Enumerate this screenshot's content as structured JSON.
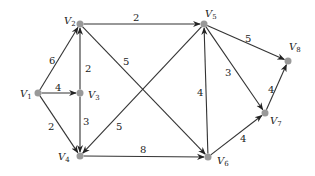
{
  "graph": {
    "nodes": [
      {
        "id": "V1",
        "label": "V",
        "sub": "1",
        "x": 38,
        "y": 93,
        "lx": 20,
        "ly": 97
      },
      {
        "id": "V2",
        "label": "V",
        "sub": "2",
        "x": 80,
        "y": 24,
        "lx": 64,
        "ly": 24
      },
      {
        "id": "V3",
        "label": "V",
        "sub": "3",
        "x": 80,
        "y": 93,
        "lx": 88,
        "ly": 98
      },
      {
        "id": "V4",
        "label": "V",
        "sub": "4",
        "x": 80,
        "y": 156,
        "lx": 58,
        "ly": 160
      },
      {
        "id": "V5",
        "label": "V",
        "sub": "5",
        "x": 204,
        "y": 24,
        "lx": 205,
        "ly": 17
      },
      {
        "id": "V6",
        "label": "V",
        "sub": "6",
        "x": 208,
        "y": 157,
        "lx": 217,
        "ly": 164
      },
      {
        "id": "V7",
        "label": "V",
        "sub": "7",
        "x": 265,
        "y": 113,
        "lx": 270,
        "ly": 124
      },
      {
        "id": "V8",
        "label": "V",
        "sub": "8",
        "x": 288,
        "y": 61,
        "lx": 289,
        "ly": 50
      }
    ],
    "edges": [
      {
        "from": "V1",
        "to": "V2",
        "weight": "6",
        "wx": 49,
        "wy": 64
      },
      {
        "from": "V1",
        "to": "V3",
        "weight": "4",
        "wx": 55,
        "wy": 91
      },
      {
        "from": "V1",
        "to": "V4",
        "weight": "2",
        "wx": 48,
        "wy": 130
      },
      {
        "from": "V3",
        "to": "V2",
        "weight": "2",
        "wx": 85,
        "wy": 72
      },
      {
        "from": "V3",
        "to": "V4",
        "weight": "3",
        "wx": 83,
        "wy": 125
      },
      {
        "from": "V2",
        "to": "V5",
        "weight": "2",
        "wx": 133,
        "wy": 21
      },
      {
        "from": "V2",
        "to": "V6",
        "weight": "5",
        "wx": 123,
        "wy": 65
      },
      {
        "from": "V5",
        "to": "V4",
        "weight": "5",
        "wx": 116,
        "wy": 130
      },
      {
        "from": "V4",
        "to": "V6",
        "weight": "8",
        "wx": 140,
        "wy": 153
      },
      {
        "from": "V6",
        "to": "V5",
        "weight": "4",
        "wx": 197,
        "wy": 96
      },
      {
        "from": "V5",
        "to": "V7",
        "weight": "3",
        "wx": 225,
        "wy": 76
      },
      {
        "from": "V5",
        "to": "V8",
        "weight": "5",
        "wx": 245,
        "wy": 42
      },
      {
        "from": "V6",
        "to": "V7",
        "weight": "4",
        "wx": 240,
        "wy": 142
      },
      {
        "from": "V7",
        "to": "V8",
        "weight": "4",
        "wx": 268,
        "wy": 93
      }
    ]
  }
}
